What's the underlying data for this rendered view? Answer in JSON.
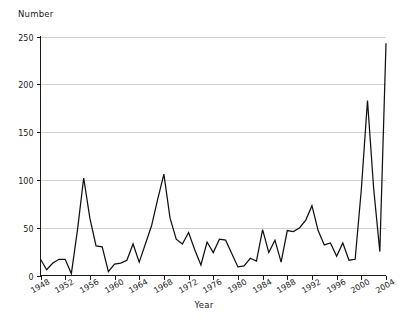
{
  "chart_data": {
    "type": "line",
    "title": "",
    "xlabel": "Year",
    "ylabel": "Number",
    "xlim": [
      1948,
      2004
    ],
    "ylim": [
      0,
      250
    ],
    "grid": true,
    "legend": null,
    "y_ticks": [
      0,
      50,
      100,
      150,
      200,
      250
    ],
    "x_ticks": [
      1948,
      1952,
      1956,
      1960,
      1964,
      1968,
      1972,
      1976,
      1980,
      1984,
      1988,
      1992,
      1996,
      2000,
      2004
    ],
    "x": [
      1948,
      1949,
      1950,
      1951,
      1952,
      1953,
      1954,
      1955,
      1956,
      1957,
      1958,
      1959,
      1960,
      1961,
      1962,
      1963,
      1964,
      1965,
      1966,
      1967,
      1968,
      1969,
      1970,
      1971,
      1972,
      1973,
      1974,
      1975,
      1976,
      1977,
      1978,
      1979,
      1980,
      1981,
      1982,
      1983,
      1984,
      1985,
      1986,
      1987,
      1988,
      1989,
      1990,
      1991,
      1992,
      1993,
      1994,
      1995,
      1996,
      1997,
      1998,
      1999,
      2000,
      2001,
      2002,
      2003,
      2004
    ],
    "values": [
      17,
      6,
      13,
      17,
      17,
      2,
      48,
      102,
      60,
      31,
      30,
      4,
      12,
      13,
      16,
      33,
      14,
      33,
      52,
      80,
      106,
      60,
      38,
      33,
      45,
      27,
      11,
      35,
      24,
      38,
      37,
      23,
      9,
      10,
      18,
      15,
      48,
      24,
      37,
      14,
      47,
      46,
      50,
      58,
      73,
      47,
      32,
      34,
      20,
      34,
      16,
      17,
      90,
      183,
      91,
      25,
      243
    ],
    "series": [
      {
        "name": "Number",
        "values": [
          17,
          6,
          13,
          17,
          17,
          2,
          48,
          102,
          60,
          31,
          30,
          4,
          12,
          13,
          16,
          33,
          14,
          33,
          52,
          80,
          106,
          60,
          38,
          33,
          45,
          27,
          11,
          35,
          24,
          38,
          37,
          23,
          9,
          10,
          18,
          15,
          48,
          24,
          37,
          14,
          47,
          46,
          50,
          58,
          73,
          47,
          32,
          34,
          20,
          34,
          16,
          17,
          90,
          183,
          91,
          25,
          243
        ]
      }
    ]
  },
  "labels": {
    "y_axis_title": "Number",
    "x_axis_title": "Year"
  },
  "colors": {
    "line": "#111111",
    "grid": "#cccccc",
    "axis": "#1a1a1a",
    "background": "#ffffff"
  }
}
